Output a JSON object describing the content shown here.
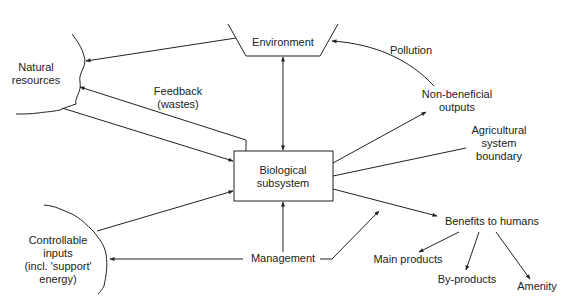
{
  "diagram": {
    "nodes": {
      "environment": "Environment",
      "natural_resources_1": "Natural",
      "natural_resources_2": "resources",
      "biological_1": "Biological",
      "biological_2": "subsystem",
      "controllable_1": "Controllable",
      "controllable_2": "inputs",
      "controllable_3": "(incl. 'support'",
      "controllable_4": "energy)",
      "management": "Management",
      "benefits": "Benefits to humans",
      "main_products": "Main products",
      "by_products": "By-products",
      "amenity": "Amenity",
      "non_beneficial_1": "Non-beneficial",
      "non_beneficial_2": "outputs"
    },
    "edge_labels": {
      "feedback_1": "Feedback",
      "feedback_2": "(wastes)",
      "pollution": "Pollution",
      "boundary_1": "Agricultural",
      "boundary_2": "system",
      "boundary_3": "boundary"
    },
    "colors": {
      "line": "#222222",
      "text": "#222222",
      "background": "#ffffff"
    }
  }
}
